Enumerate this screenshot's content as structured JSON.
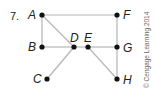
{
  "problem_number": "7.",
  "copyright": "© Cengage Learning 2014",
  "nodes": [
    {
      "id": "A",
      "x": 42,
      "y": 15,
      "lx": 28,
      "ly": 19
    },
    {
      "id": "B",
      "x": 42,
      "y": 47,
      "lx": 28,
      "ly": 51
    },
    {
      "id": "C",
      "x": 47,
      "y": 79,
      "lx": 33,
      "ly": 83
    },
    {
      "id": "D",
      "x": 74,
      "y": 47,
      "lx": 70,
      "ly": 42
    },
    {
      "id": "E",
      "x": 88,
      "y": 47,
      "lx": 84,
      "ly": 42
    },
    {
      "id": "F",
      "x": 117,
      "y": 15,
      "lx": 123,
      "ly": 19
    },
    {
      "id": "G",
      "x": 117,
      "y": 47,
      "lx": 123,
      "ly": 52
    },
    {
      "id": "H",
      "x": 117,
      "y": 79,
      "lx": 123,
      "ly": 84
    }
  ],
  "edges": [
    [
      "A",
      "F"
    ],
    [
      "A",
      "B"
    ],
    [
      "A",
      "D"
    ],
    [
      "B",
      "D"
    ],
    [
      "D",
      "E"
    ],
    [
      "D",
      "C"
    ],
    [
      "E",
      "G"
    ],
    [
      "E",
      "H"
    ],
    [
      "F",
      "G"
    ],
    [
      "G",
      "H"
    ]
  ],
  "colors": {
    "edge": "#b5b5b5",
    "node": "#111111"
  }
}
